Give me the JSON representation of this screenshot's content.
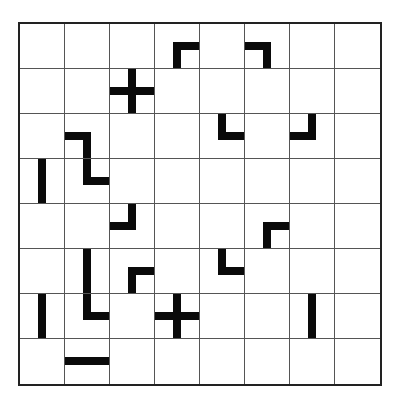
{
  "puzzle": {
    "rows": 8,
    "cols": 8,
    "line_color": "#0a0a0a",
    "grid_color": "#555555",
    "pieces": [
      {
        "row": 0,
        "col": 3,
        "type": "corner",
        "arms": [
          "right",
          "down"
        ]
      },
      {
        "row": 0,
        "col": 5,
        "type": "corner",
        "arms": [
          "left",
          "down"
        ]
      },
      {
        "row": 1,
        "col": 2,
        "type": "cross",
        "arms": [
          "up",
          "down",
          "left",
          "right"
        ]
      },
      {
        "row": 2,
        "col": 1,
        "type": "corner",
        "arms": [
          "left",
          "down"
        ]
      },
      {
        "row": 2,
        "col": 4,
        "type": "corner",
        "arms": [
          "up",
          "right"
        ]
      },
      {
        "row": 2,
        "col": 6,
        "type": "corner",
        "arms": [
          "up",
          "left"
        ]
      },
      {
        "row": 3,
        "col": 0,
        "type": "straight",
        "arms": [
          "up",
          "down"
        ]
      },
      {
        "row": 3,
        "col": 1,
        "type": "corner",
        "arms": [
          "up",
          "right"
        ]
      },
      {
        "row": 4,
        "col": 2,
        "type": "corner",
        "arms": [
          "up",
          "left"
        ]
      },
      {
        "row": 4,
        "col": 5,
        "type": "corner",
        "arms": [
          "right",
          "down"
        ]
      },
      {
        "row": 5,
        "col": 1,
        "type": "straight",
        "arms": [
          "up",
          "down"
        ]
      },
      {
        "row": 5,
        "col": 2,
        "type": "corner",
        "arms": [
          "right",
          "down"
        ]
      },
      {
        "row": 5,
        "col": 4,
        "type": "corner",
        "arms": [
          "up",
          "right"
        ]
      },
      {
        "row": 6,
        "col": 0,
        "type": "straight",
        "arms": [
          "up",
          "down"
        ]
      },
      {
        "row": 6,
        "col": 1,
        "type": "corner",
        "arms": [
          "up",
          "right"
        ]
      },
      {
        "row": 6,
        "col": 3,
        "type": "cross",
        "arms": [
          "up",
          "down",
          "left",
          "right"
        ]
      },
      {
        "row": 6,
        "col": 6,
        "type": "straight",
        "arms": [
          "up",
          "down"
        ]
      },
      {
        "row": 7,
        "col": 1,
        "type": "straight",
        "arms": [
          "left",
          "right"
        ]
      }
    ]
  }
}
